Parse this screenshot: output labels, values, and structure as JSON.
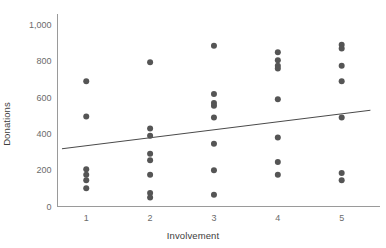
{
  "chart_data": {
    "type": "scatter",
    "title": "",
    "xlabel": "Involvement",
    "ylabel": "Donations",
    "xlim": [
      0.55,
      5.6
    ],
    "ylim": [
      0,
      1060
    ],
    "grid": false,
    "legend": null,
    "xticks": [
      "1",
      "2",
      "3",
      "4",
      "5"
    ],
    "xtick_values": [
      1,
      2,
      3,
      4,
      5
    ],
    "yticks": [
      "0",
      "200",
      "400",
      "600",
      "800",
      "1,000"
    ],
    "ytick_values": [
      0,
      200,
      400,
      600,
      800,
      1000
    ],
    "point_color": "#555555",
    "line_color": "#4a4a4a",
    "axis_color": "#9a9a9a",
    "marker": "circle",
    "marker_size": 3,
    "points": [
      {
        "x": 1,
        "y": 690
      },
      {
        "x": 1,
        "y": 495
      },
      {
        "x": 1,
        "y": 205
      },
      {
        "x": 1,
        "y": 175
      },
      {
        "x": 1,
        "y": 145
      },
      {
        "x": 1,
        "y": 100
      },
      {
        "x": 2,
        "y": 795
      },
      {
        "x": 2,
        "y": 430
      },
      {
        "x": 2,
        "y": 390
      },
      {
        "x": 2,
        "y": 290
      },
      {
        "x": 2,
        "y": 255
      },
      {
        "x": 2,
        "y": 175
      },
      {
        "x": 2,
        "y": 75
      },
      {
        "x": 2,
        "y": 50
      },
      {
        "x": 3,
        "y": 885
      },
      {
        "x": 3,
        "y": 620
      },
      {
        "x": 3,
        "y": 570
      },
      {
        "x": 3,
        "y": 555
      },
      {
        "x": 3,
        "y": 490
      },
      {
        "x": 3,
        "y": 345
      },
      {
        "x": 3,
        "y": 200
      },
      {
        "x": 3,
        "y": 65
      },
      {
        "x": 4,
        "y": 850
      },
      {
        "x": 4,
        "y": 805
      },
      {
        "x": 4,
        "y": 775
      },
      {
        "x": 4,
        "y": 760
      },
      {
        "x": 4,
        "y": 590
      },
      {
        "x": 4,
        "y": 380
      },
      {
        "x": 4,
        "y": 245
      },
      {
        "x": 4,
        "y": 175
      },
      {
        "x": 5,
        "y": 890
      },
      {
        "x": 5,
        "y": 870
      },
      {
        "x": 5,
        "y": 775
      },
      {
        "x": 5,
        "y": 690
      },
      {
        "x": 5,
        "y": 490
      },
      {
        "x": 5,
        "y": 185
      },
      {
        "x": 5,
        "y": 145
      }
    ],
    "trendline": {
      "x_start": 0.62,
      "y_start": 318,
      "x_end": 5.45,
      "y_end": 530
    }
  }
}
